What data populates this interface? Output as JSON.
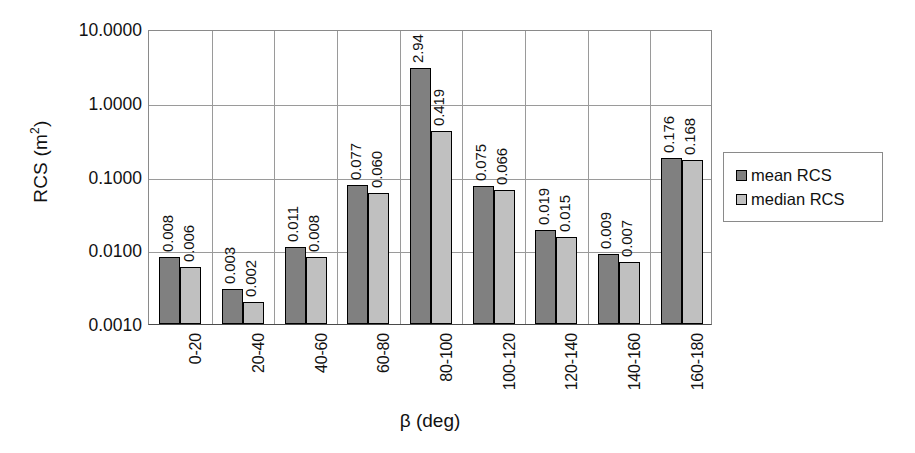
{
  "chart_data": {
    "type": "bar",
    "title": "",
    "xlabel": "β (deg)",
    "ylabel": "RCS (m²)",
    "ylabel_base": "RCS (m",
    "ylabel_sup": "2",
    "ylabel_close": ")",
    "yscale": "log",
    "ylim": [
      0.001,
      10.0
    ],
    "ytick_labels": [
      "10.0000",
      "1.0000",
      "0.1000",
      "0.0100",
      "0.0010"
    ],
    "ytick_values": [
      10.0,
      1.0,
      0.1,
      0.01,
      0.001
    ],
    "grid": true,
    "legend_position": "right",
    "categories": [
      "0-20",
      "20-40",
      "40-60",
      "60-80",
      "80-100",
      "100-120",
      "120-140",
      "140-160",
      "160-180"
    ],
    "series": [
      {
        "name": "mean RCS",
        "color": "#808080",
        "values": [
          0.008,
          0.003,
          0.011,
          0.077,
          2.94,
          0.075,
          0.019,
          0.009,
          0.176
        ],
        "labels": [
          "0.008",
          "0.003",
          "0.011",
          "0.077",
          "2.94",
          "0.075",
          "0.019",
          "0.009",
          "0.176"
        ]
      },
      {
        "name": "median RCS",
        "color": "#c0c0c0",
        "values": [
          0.006,
          0.002,
          0.008,
          0.06,
          0.419,
          0.066,
          0.015,
          0.007,
          0.168
        ],
        "labels": [
          "0.006",
          "0.002",
          "0.008",
          "0.060",
          "0.419",
          "0.066",
          "0.015",
          "0.007",
          "0.168"
        ]
      }
    ]
  },
  "legend": {
    "items": [
      {
        "label": "mean RCS",
        "color": "#808080"
      },
      {
        "label": "median RCS",
        "color": "#c0c0c0"
      }
    ]
  }
}
